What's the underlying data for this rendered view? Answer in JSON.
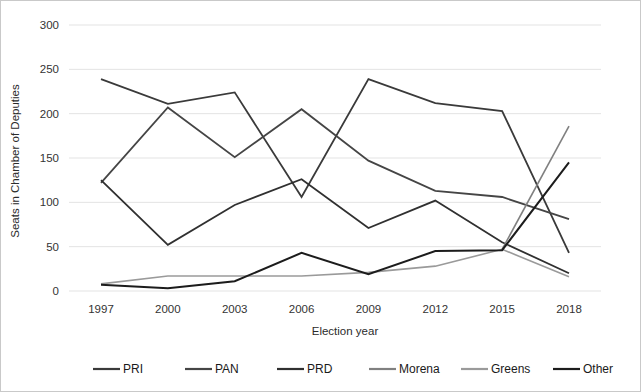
{
  "chart_data": {
    "type": "line",
    "title": "",
    "xlabel": "Election year",
    "ylabel": "Seats in Chamber of Deputies",
    "categories": [
      "1997",
      "2000",
      "2003",
      "2006",
      "2009",
      "2012",
      "2015",
      "2018"
    ],
    "x": [
      1997,
      2000,
      2003,
      2006,
      2009,
      2012,
      2015,
      2018
    ],
    "ylim": [
      0,
      300
    ],
    "yticks": [
      0,
      50,
      100,
      150,
      200,
      250,
      300
    ],
    "ytick_labels": [
      "0",
      "50",
      "100",
      "150",
      "200",
      "250",
      "300"
    ],
    "grid": "horizontal",
    "legend_position": "bottom",
    "series": [
      {
        "name": "PRI",
        "color": "#3a3a3a",
        "width": 1.8,
        "values": [
          239,
          211,
          224,
          106,
          239,
          212,
          203,
          43
        ]
      },
      {
        "name": "PAN",
        "color": "#454545",
        "width": 1.8,
        "values": [
          122,
          207,
          151,
          205,
          147,
          113,
          106,
          81
        ]
      },
      {
        "name": "PRD",
        "color": "#303030",
        "width": 1.8,
        "values": [
          125,
          52,
          97,
          126,
          71,
          102,
          55,
          20
        ]
      },
      {
        "name": "Morena",
        "color": "#808080",
        "width": 1.6,
        "values": [
          null,
          null,
          null,
          null,
          null,
          null,
          47,
          186
        ]
      },
      {
        "name": "Greens",
        "color": "#9a9a9a",
        "width": 1.6,
        "values": [
          8,
          17,
          17,
          17,
          21,
          28,
          47,
          16
        ]
      },
      {
        "name": "Other",
        "color": "#1c1c1c",
        "width": 2.0,
        "values": [
          7,
          3,
          11,
          43,
          19,
          45,
          46,
          145
        ]
      }
    ]
  },
  "legend": {
    "items": [
      {
        "label": "PRI",
        "color": "#3a3a3a"
      },
      {
        "label": "PAN",
        "color": "#454545"
      },
      {
        "label": "PRD",
        "color": "#303030"
      },
      {
        "label": "Morena",
        "color": "#808080"
      },
      {
        "label": "Greens",
        "color": "#9a9a9a"
      },
      {
        "label": "Other",
        "color": "#1c1c1c"
      }
    ]
  }
}
